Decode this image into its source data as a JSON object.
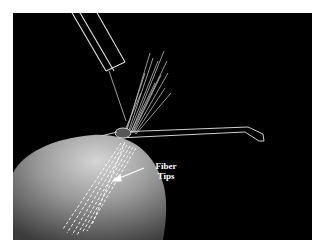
{
  "figure": {
    "background_color": "#000000",
    "annotation": {
      "line1": "Fiber",
      "line2": "Tips"
    }
  }
}
